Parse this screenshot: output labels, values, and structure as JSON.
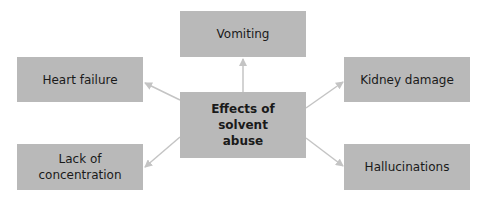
{
  "diagram": {
    "center": {
      "label": "Effects of solvent abuse",
      "line1": "Effects of solvent",
      "line2": "abuse"
    },
    "effects": [
      {
        "id": "vomiting",
        "label": "Vomiting"
      },
      {
        "id": "heart-failure",
        "label": "Heart failure"
      },
      {
        "id": "kidney-damage",
        "label": "Kidney damage"
      },
      {
        "id": "lack-of-concentration",
        "label": "Lack of concentration",
        "line1": "Lack of",
        "line2": "concentration"
      },
      {
        "id": "hallucinations",
        "label": "Hallucinations"
      }
    ],
    "colors": {
      "box": "#b9b9b9",
      "arrow": "#c4c4c4",
      "text": "#1a1a1a",
      "background": "#ffffff"
    }
  }
}
